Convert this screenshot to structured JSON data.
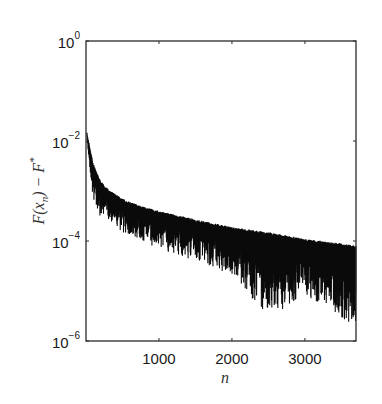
{
  "chart_data": {
    "type": "line",
    "title": "",
    "xlabel": "n",
    "ylabel": "F(x_n) − F*",
    "yscale": "log",
    "xlim": [
      0,
      3700
    ],
    "ylim": [
      1e-06,
      1
    ],
    "grid": false,
    "legend": null,
    "x_ticks": [
      1000,
      2000,
      3000
    ],
    "x_tick_labels": [
      "1000",
      "2000",
      "3000"
    ],
    "y_ticks": [
      1,
      0.01,
      0.0001,
      1e-06
    ],
    "y_tick_labels": [
      {
        "base": "10",
        "exp": "0"
      },
      {
        "base": "10",
        "exp": "-2"
      },
      {
        "base": "10",
        "exp": "-4"
      },
      {
        "base": "10",
        "exp": "-6"
      }
    ],
    "series": [
      {
        "name": "upper envelope",
        "x": [
          10,
          100,
          200,
          300,
          500,
          750,
          1000,
          1500,
          2000,
          2500,
          3000,
          3500,
          3700
        ],
        "values": [
          0.016,
          0.0035,
          0.0016,
          0.0011,
          0.0007,
          0.0005,
          0.0004,
          0.00027,
          0.00019,
          0.00015,
          0.00011,
          9e-05,
          8e-05
        ]
      },
      {
        "name": "lower envelope (oscillation minima)",
        "x": [
          10,
          100,
          200,
          300,
          500,
          750,
          1000,
          1500,
          2000,
          2500,
          3000,
          3500,
          3700
        ],
        "values": [
          0.01,
          0.0006,
          0.0003,
          0.00028,
          0.00015,
          0.0001,
          7e-05,
          4e-05,
          2e-05,
          3e-06,
          8e-06,
          3e-06,
          1.5e-06
        ]
      }
    ]
  },
  "axes": {
    "xlabel": "n",
    "ylabel_parts": {
      "F": "F",
      "x": "x",
      "sub": "n",
      "star": "*"
    }
  }
}
